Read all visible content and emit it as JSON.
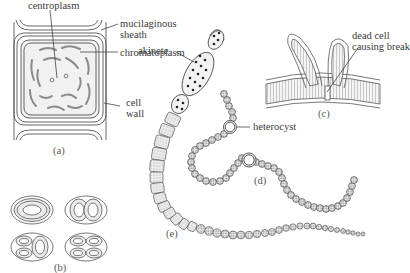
{
  "figure": {
    "panels": {
      "a": {
        "label": "(a)",
        "labels": {
          "centroplasm": "centroplasm",
          "mucilaginous_sheath_line1": "mucilaginous",
          "mucilaginous_sheath_line2": "sheath",
          "chromatoplasm": "chromatoplasm",
          "cell_wall_line1": "cell",
          "cell_wall_line2": "wall"
        }
      },
      "b": {
        "label": "(b)"
      },
      "c": {
        "label": "(c)",
        "labels": {
          "dead_cell_line1": "dead cell",
          "dead_cell_line2": "causing break"
        }
      },
      "d": {
        "label": "(d)",
        "labels": {
          "heterocyst": "heterocyst"
        }
      },
      "e": {
        "label": "(e)",
        "labels": {
          "akinete": "akinete"
        }
      }
    },
    "colors": {
      "line": "#555555",
      "stipple": "#9a9a9a",
      "granule": "#222222",
      "cell_fill": "#e4e4e4"
    }
  }
}
